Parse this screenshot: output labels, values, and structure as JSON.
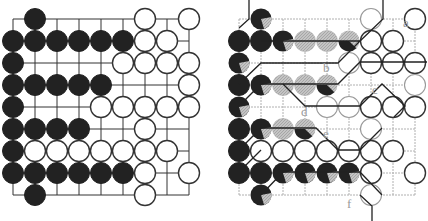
{
  "figure": {
    "colors": {
      "black": "#222222",
      "white": "#ffffff",
      "grey": "#b8b8b8",
      "line": "#333333",
      "faint_line": "#aaaaaa",
      "label": "#9a9a9a"
    }
  },
  "left_board": {
    "cols": 9,
    "rows": 9,
    "origin": [
      13,
      19
    ],
    "spacing": 22,
    "stones": [
      {
        "r": 0,
        "c": 1,
        "color": "B"
      },
      {
        "r": 0,
        "c": 6,
        "color": "W"
      },
      {
        "r": 0,
        "c": 8,
        "color": "W"
      },
      {
        "r": 1,
        "c": 0,
        "color": "B"
      },
      {
        "r": 1,
        "c": 1,
        "color": "B"
      },
      {
        "r": 1,
        "c": 2,
        "color": "B"
      },
      {
        "r": 1,
        "c": 3,
        "color": "B"
      },
      {
        "r": 1,
        "c": 4,
        "color": "B"
      },
      {
        "r": 1,
        "c": 5,
        "color": "B"
      },
      {
        "r": 1,
        "c": 6,
        "color": "W"
      },
      {
        "r": 1,
        "c": 7,
        "color": "W"
      },
      {
        "r": 2,
        "c": 0,
        "color": "B"
      },
      {
        "r": 2,
        "c": 5,
        "color": "W"
      },
      {
        "r": 2,
        "c": 6,
        "color": "W"
      },
      {
        "r": 2,
        "c": 7,
        "color": "W"
      },
      {
        "r": 2,
        "c": 8,
        "color": "W"
      },
      {
        "r": 3,
        "c": 0,
        "color": "B"
      },
      {
        "r": 3,
        "c": 1,
        "color": "B"
      },
      {
        "r": 3,
        "c": 2,
        "color": "B"
      },
      {
        "r": 3,
        "c": 3,
        "color": "B"
      },
      {
        "r": 3,
        "c": 4,
        "color": "B"
      },
      {
        "r": 3,
        "c": 8,
        "color": "W"
      },
      {
        "r": 4,
        "c": 0,
        "color": "B"
      },
      {
        "r": 4,
        "c": 4,
        "color": "W"
      },
      {
        "r": 4,
        "c": 5,
        "color": "W"
      },
      {
        "r": 4,
        "c": 6,
        "color": "W"
      },
      {
        "r": 4,
        "c": 7,
        "color": "W"
      },
      {
        "r": 4,
        "c": 8,
        "color": "W"
      },
      {
        "r": 5,
        "c": 0,
        "color": "B"
      },
      {
        "r": 5,
        "c": 1,
        "color": "B"
      },
      {
        "r": 5,
        "c": 2,
        "color": "B"
      },
      {
        "r": 5,
        "c": 3,
        "color": "B"
      },
      {
        "r": 5,
        "c": 6,
        "color": "W"
      },
      {
        "r": 6,
        "c": 0,
        "color": "B"
      },
      {
        "r": 6,
        "c": 1,
        "color": "W"
      },
      {
        "r": 6,
        "c": 2,
        "color": "W"
      },
      {
        "r": 6,
        "c": 3,
        "color": "W"
      },
      {
        "r": 6,
        "c": 4,
        "color": "W"
      },
      {
        "r": 6,
        "c": 5,
        "color": "W"
      },
      {
        "r": 6,
        "c": 6,
        "color": "W"
      },
      {
        "r": 6,
        "c": 7,
        "color": "W"
      },
      {
        "r": 7,
        "c": 0,
        "color": "B"
      },
      {
        "r": 7,
        "c": 1,
        "color": "B"
      },
      {
        "r": 7,
        "c": 2,
        "color": "B"
      },
      {
        "r": 7,
        "c": 3,
        "color": "B"
      },
      {
        "r": 7,
        "c": 4,
        "color": "B"
      },
      {
        "r": 7,
        "c": 5,
        "color": "B"
      },
      {
        "r": 7,
        "c": 6,
        "color": "W"
      },
      {
        "r": 7,
        "c": 8,
        "color": "W"
      },
      {
        "r": 8,
        "c": 1,
        "color": "B"
      },
      {
        "r": 8,
        "c": 6,
        "color": "W"
      }
    ]
  },
  "right_board": {
    "cols": 9,
    "rows": 9,
    "origin": [
      239,
      19
    ],
    "spacing": 22,
    "stones": [
      {
        "r": 0,
        "c": 1,
        "color": "BG"
      },
      {
        "r": 0,
        "c": 6,
        "color": "WF"
      },
      {
        "r": 0,
        "c": 8,
        "color": "W"
      },
      {
        "r": 1,
        "c": 0,
        "color": "B"
      },
      {
        "r": 1,
        "c": 1,
        "color": "B"
      },
      {
        "r": 1,
        "c": 2,
        "color": "BG"
      },
      {
        "r": 1,
        "c": 3,
        "color": "G"
      },
      {
        "r": 1,
        "c": 4,
        "color": "G"
      },
      {
        "r": 1,
        "c": 5,
        "color": "GB"
      },
      {
        "r": 1,
        "c": 6,
        "color": "W"
      },
      {
        "r": 1,
        "c": 7,
        "color": "W"
      },
      {
        "r": 2,
        "c": 0,
        "color": "BG"
      },
      {
        "r": 2,
        "c": 5,
        "color": "WF"
      },
      {
        "r": 2,
        "c": 6,
        "color": "W"
      },
      {
        "r": 2,
        "c": 7,
        "color": "W"
      },
      {
        "r": 2,
        "c": 8,
        "color": "W"
      },
      {
        "r": 3,
        "c": 0,
        "color": "B"
      },
      {
        "r": 3,
        "c": 1,
        "color": "BG"
      },
      {
        "r": 3,
        "c": 2,
        "color": "G"
      },
      {
        "r": 3,
        "c": 3,
        "color": "G"
      },
      {
        "r": 3,
        "c": 4,
        "color": "GB"
      },
      {
        "r": 3,
        "c": 8,
        "color": "WF"
      },
      {
        "r": 4,
        "c": 0,
        "color": "BG"
      },
      {
        "r": 4,
        "c": 4,
        "color": "WF"
      },
      {
        "r": 4,
        "c": 5,
        "color": "WF"
      },
      {
        "r": 4,
        "c": 6,
        "color": "W"
      },
      {
        "r": 4,
        "c": 7,
        "color": "W"
      },
      {
        "r": 4,
        "c": 8,
        "color": "W"
      },
      {
        "r": 5,
        "c": 0,
        "color": "B"
      },
      {
        "r": 5,
        "c": 1,
        "color": "BG"
      },
      {
        "r": 5,
        "c": 2,
        "color": "G"
      },
      {
        "r": 5,
        "c": 3,
        "color": "GB"
      },
      {
        "r": 5,
        "c": 6,
        "color": "WF"
      },
      {
        "r": 6,
        "c": 0,
        "color": "B"
      },
      {
        "r": 6,
        "c": 1,
        "color": "W"
      },
      {
        "r": 6,
        "c": 2,
        "color": "W"
      },
      {
        "r": 6,
        "c": 3,
        "color": "W"
      },
      {
        "r": 6,
        "c": 4,
        "color": "W"
      },
      {
        "r": 6,
        "c": 5,
        "color": "W"
      },
      {
        "r": 6,
        "c": 6,
        "color": "W"
      },
      {
        "r": 6,
        "c": 7,
        "color": "W"
      },
      {
        "r": 7,
        "c": 0,
        "color": "B"
      },
      {
        "r": 7,
        "c": 1,
        "color": "B"
      },
      {
        "r": 7,
        "c": 2,
        "color": "BG"
      },
      {
        "r": 7,
        "c": 3,
        "color": "BG"
      },
      {
        "r": 7,
        "c": 4,
        "color": "BG"
      },
      {
        "r": 7,
        "c": 5,
        "color": "BG"
      },
      {
        "r": 7,
        "c": 6,
        "color": "W"
      },
      {
        "r": 7,
        "c": 8,
        "color": "W"
      },
      {
        "r": 8,
        "c": 1,
        "color": "BG"
      },
      {
        "r": 8,
        "c": 6,
        "color": "WF"
      }
    ],
    "labels": [
      {
        "text": "a",
        "x": 403,
        "y": 27
      },
      {
        "text": "b",
        "x": 323,
        "y": 72
      },
      {
        "text": "c",
        "x": 372,
        "y": 94
      },
      {
        "text": "d",
        "x": 301,
        "y": 116
      },
      {
        "text": "e",
        "x": 323,
        "y": 138
      },
      {
        "text": "f",
        "x": 347,
        "y": 208
      }
    ]
  }
}
